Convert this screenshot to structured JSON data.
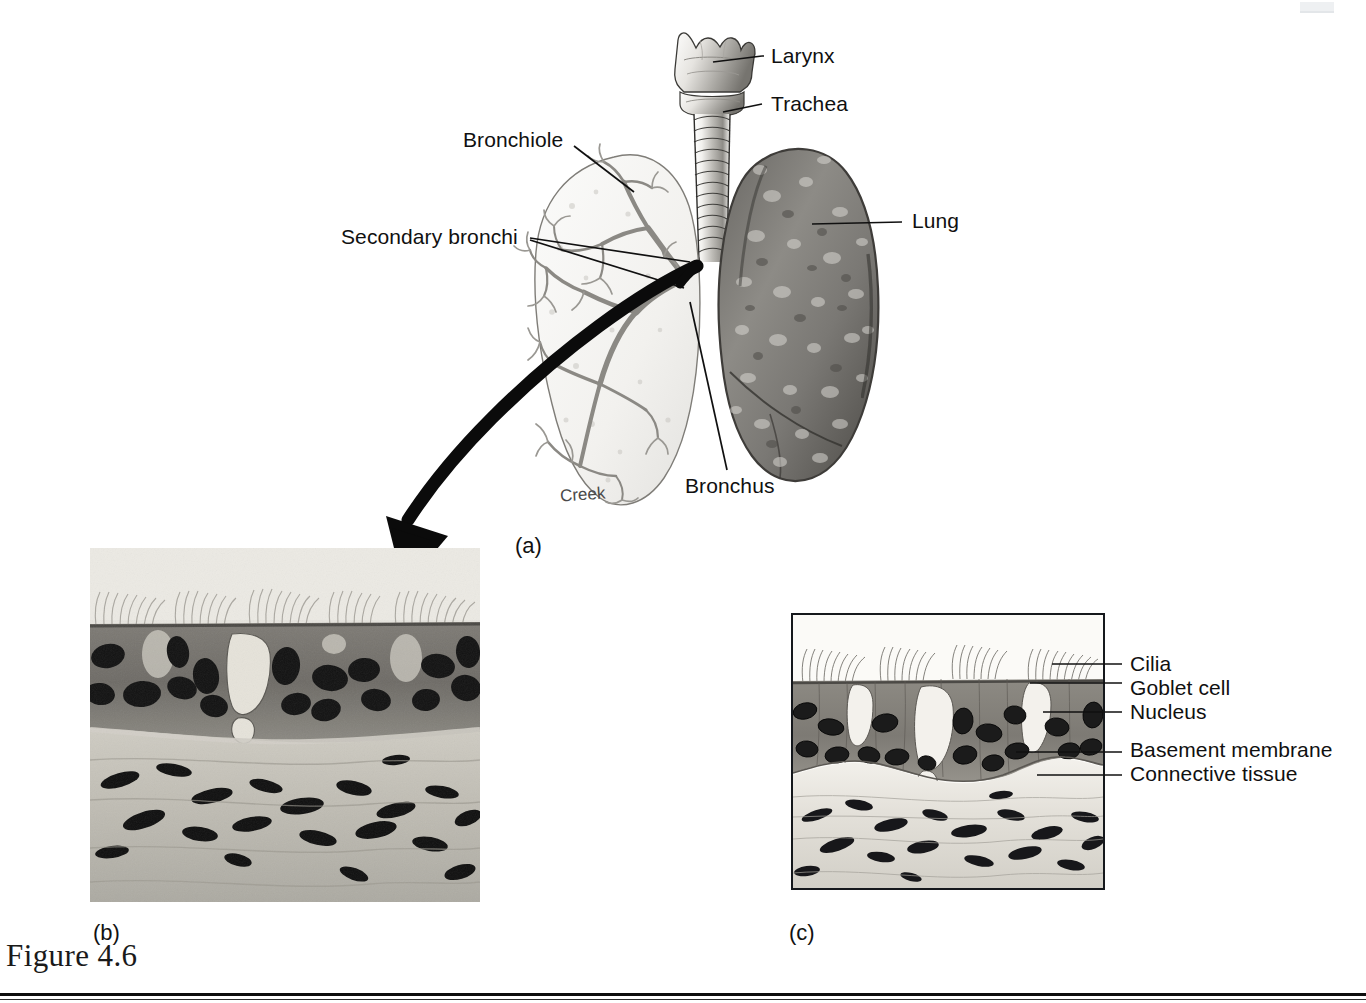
{
  "figure": {
    "caption": "Figure 4.6",
    "artist_signature": "Creek"
  },
  "panels": [
    {
      "id": "a",
      "label": "(a)",
      "description": "Respiratory tract gross anatomy"
    },
    {
      "id": "b",
      "label": "(b)",
      "description": "Photomicrograph of pseudostratified ciliated columnar epithelium"
    },
    {
      "id": "c",
      "label": "(c)",
      "description": "Line drawing of pseudostratified ciliated columnar epithelium"
    }
  ],
  "panel_a": {
    "label": "(a)",
    "callouts": [
      {
        "name": "larynx",
        "text": "Larynx"
      },
      {
        "name": "trachea",
        "text": "Trachea"
      },
      {
        "name": "bronchiole",
        "text": "Bronchiole"
      },
      {
        "name": "secondary-bronchi",
        "text": "Secondary bronchi"
      },
      {
        "name": "lung",
        "text": "Lung"
      },
      {
        "name": "bronchus",
        "text": "Bronchus"
      }
    ]
  },
  "panel_b": {
    "label": "(b)"
  },
  "panel_c": {
    "label": "(c)",
    "callouts": [
      {
        "name": "cilia",
        "text": "Cilia"
      },
      {
        "name": "goblet-cell",
        "text": "Goblet cell"
      },
      {
        "name": "nucleus",
        "text": "Nucleus"
      },
      {
        "name": "basement-membrane",
        "text": "Basement membrane"
      },
      {
        "name": "connective-tissue",
        "text": "Connective tissue"
      }
    ]
  },
  "colors": {
    "ink": "#101010",
    "page": "#ffffff",
    "epithelium": "#8e8b84",
    "nucleus": "#141414",
    "connective": "#e2ded4",
    "lung_tissue": "#7d7b77"
  }
}
